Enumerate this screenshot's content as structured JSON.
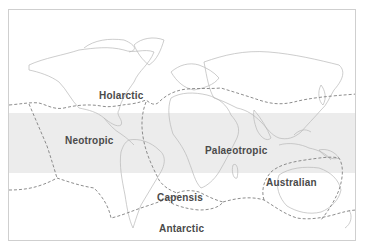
{
  "map": {
    "type": "biogeographic floristic kingdoms world map",
    "band_color": "#ececec",
    "boundary_style": "dashed",
    "regions": [
      {
        "id": "holarctic",
        "label": "Holarctic"
      },
      {
        "id": "neotropic",
        "label": "Neotropic"
      },
      {
        "id": "palaeotropic",
        "label": "Palaeotropic"
      },
      {
        "id": "australian",
        "label": "Australian"
      },
      {
        "id": "capensis",
        "label": "Capensis"
      },
      {
        "id": "antarctic",
        "label": "Antarctic"
      }
    ]
  }
}
